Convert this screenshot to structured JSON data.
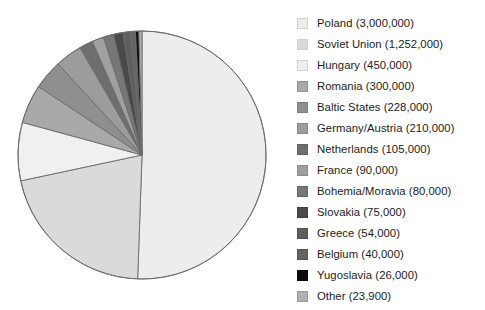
{
  "chart_data": {
    "type": "pie",
    "title": "",
    "subtitle": "",
    "xlabel": "",
    "ylabel": "",
    "legend_position": "right",
    "grid": false,
    "start_angle_deg": 0,
    "direction": "clockwise",
    "total": 5933900,
    "categories": [
      "Poland",
      "Soviet Union",
      "Hungary",
      "Romania",
      "Baltic States",
      "Germany/Austria",
      "Netherlands",
      "France",
      "Bohemia/Moravia",
      "Slovakia",
      "Greece",
      "Belgium",
      "Yugoslavia",
      "Other"
    ],
    "values": [
      3000000,
      1252000,
      450000,
      300000,
      228000,
      210000,
      105000,
      90000,
      80000,
      75000,
      54000,
      40000,
      26000,
      23900
    ],
    "value_labels": [
      "3,000,000",
      "1,252,000",
      "450,000",
      "300,000",
      "228,000",
      "210,000",
      "105,000",
      "90,000",
      "80,000",
      "75,000",
      "54,000",
      "40,000",
      "26,000",
      "23,900"
    ],
    "colors": [
      "#ededed",
      "#dadada",
      "#f0f0f0",
      "#a9a9a9",
      "#8f8f8f",
      "#9c9c9c",
      "#6e6e6e",
      "#a0a0a0",
      "#777777",
      "#4a4a4a",
      "#5e5e5e",
      "#646464",
      "#0b0b0b",
      "#b0b0b0"
    ],
    "slice_border_color": "#6b6b6b"
  },
  "legend": {
    "items": [
      {
        "label": "Poland (3,000,000)",
        "color": "#ededed"
      },
      {
        "label": "Soviet Union (1,252,000)",
        "color": "#dadada"
      },
      {
        "label": "Hungary (450,000)",
        "color": "#f0f0f0"
      },
      {
        "label": "Romania (300,000)",
        "color": "#a9a9a9"
      },
      {
        "label": "Baltic States (228,000)",
        "color": "#8f8f8f"
      },
      {
        "label": "Germany/Austria (210,000)",
        "color": "#9c9c9c"
      },
      {
        "label": "Netherlands (105,000)",
        "color": "#6e6e6e"
      },
      {
        "label": "France (90,000)",
        "color": "#a0a0a0"
      },
      {
        "label": "Bohemia/Moravia (80,000)",
        "color": "#777777"
      },
      {
        "label": "Slovakia (75,000)",
        "color": "#4a4a4a"
      },
      {
        "label": "Greece (54,000)",
        "color": "#5e5e5e"
      },
      {
        "label": "Belgium (40,000)",
        "color": "#646464"
      },
      {
        "label": "Yugoslavia (26,000)",
        "color": "#0b0b0b"
      },
      {
        "label": "Other (23,900)",
        "color": "#b0b0b0"
      }
    ]
  },
  "pie_geometry": {
    "cx": 142,
    "cy": 155,
    "r": 124
  }
}
